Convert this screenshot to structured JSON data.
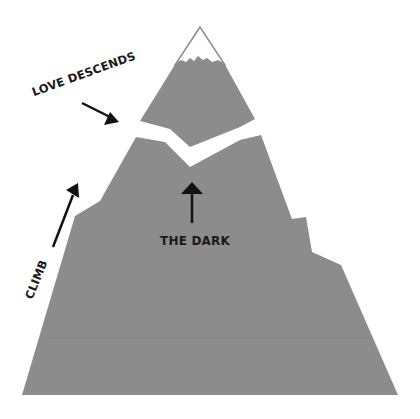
{
  "diagram": {
    "title": "",
    "labels": {
      "love_descends": "LOVE DESCENDS",
      "the_dark": "THE DARK",
      "climb": "CLIMB"
    },
    "colors": {
      "mountain": "#8c8c8c",
      "snow": "#ffffff",
      "outline": "#8c8c8c",
      "arrow": "#111111",
      "background": "#ffffff"
    },
    "elements": [
      {
        "name": "mountain-peak-snowcap",
        "description": "white snow cap at summit with grey outline"
      },
      {
        "name": "mountain-upper-section",
        "description": "grey summit section above crack"
      },
      {
        "name": "crack-band",
        "description": "white V-shaped band separating summit from lower mountain"
      },
      {
        "name": "mountain-lower-section",
        "description": "large grey lower mountain body with stepped sides"
      },
      {
        "name": "love-descends-arrow",
        "description": "arrow pointing down-right toward the crack"
      },
      {
        "name": "the-dark-arrow",
        "description": "arrow pointing up at the V of the crack"
      },
      {
        "name": "climb-arrow",
        "description": "arrow pointing up-right along left slope"
      }
    ]
  }
}
